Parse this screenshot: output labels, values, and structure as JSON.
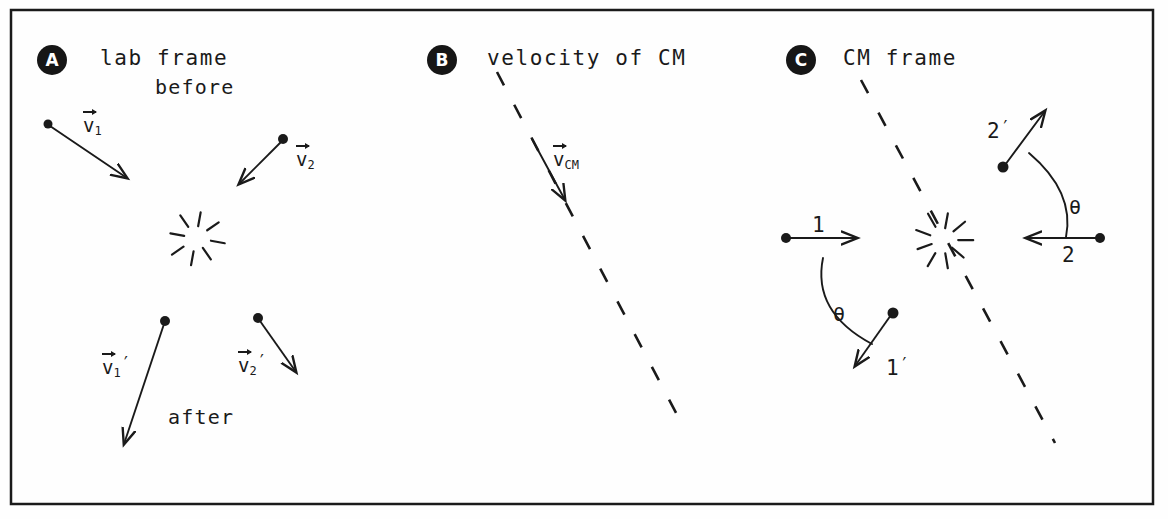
{
  "figure": {
    "width": 1168,
    "height": 519,
    "background_color": "#fefefe",
    "ink_color": "#1a1a1a",
    "border": {
      "x": 11,
      "y": 10,
      "width": 1142,
      "height": 494,
      "stroke_width": 2.5
    }
  },
  "panels": [
    {
      "id": "A",
      "badge_label": "A",
      "badge": {
        "x": 37,
        "y": 45
      },
      "title": "lab frame",
      "title_pos": {
        "x": 100,
        "y": 48
      },
      "labels": [
        {
          "name": "before",
          "text": "before",
          "x": 155,
          "y": 77
        },
        {
          "name": "after",
          "text": "after",
          "x": 168,
          "y": 407
        }
      ],
      "vectors": [
        {
          "name": "v1",
          "label_html": "v<sub>1</sub>",
          "label_x": 83,
          "label_y": 116,
          "dot": {
            "x": 48,
            "y": 124,
            "r": 4.5
          },
          "arrow": {
            "x1": 50,
            "y1": 126,
            "x2": 127,
            "y2": 178
          }
        },
        {
          "name": "v2",
          "label_html": "v<sub>2</sub>",
          "label_x": 296,
          "label_y": 150,
          "dot": {
            "x": 283,
            "y": 139,
            "r": 5
          },
          "arrow": {
            "x1": 281,
            "y1": 142,
            "x2": 239,
            "y2": 184
          }
        },
        {
          "name": "v1-prime",
          "label_html": "v<sub>1</sub>′",
          "label_x": 102,
          "label_y": 355,
          "dot": {
            "x": 165,
            "y": 321,
            "r": 5
          },
          "arrow": {
            "x1": 164,
            "y1": 324,
            "x2": 124,
            "y2": 444
          }
        },
        {
          "name": "v2-prime",
          "label_html": "v<sub>2</sub>′",
          "label_x": 238,
          "label_y": 353,
          "dot": {
            "x": 258,
            "y": 318,
            "r": 5
          },
          "arrow": {
            "x1": 260,
            "y1": 321,
            "x2": 296,
            "y2": 372
          }
        }
      ],
      "starburst": {
        "cx": 196,
        "cy": 238,
        "r_inner": 12,
        "r_outer": 26,
        "spokes": 8
      }
    },
    {
      "id": "B",
      "badge_label": "B",
      "badge": {
        "x": 427,
        "y": 45
      },
      "title": "velocity of CM",
      "title_pos": {
        "x": 487,
        "y": 48
      },
      "dashed_line": {
        "x1": 497,
        "y1": 72,
        "x2": 684,
        "y2": 428
      },
      "vectors": [
        {
          "name": "v-cm",
          "label_html": "v<sub>CM</sub>",
          "label_x": 553,
          "label_y": 150,
          "arrow": {
            "x1": 532,
            "y1": 139,
            "x2": 565,
            "y2": 200
          }
        }
      ]
    },
    {
      "id": "C",
      "badge_label": "C",
      "badge": {
        "x": 786,
        "y": 45
      },
      "title": "CM frame",
      "title_pos": {
        "x": 843,
        "y": 48
      },
      "dashed_line": {
        "x1": 861,
        "y1": 80,
        "x2": 1055,
        "y2": 443
      },
      "starburst": {
        "cx": 943,
        "cy": 240,
        "r_inner": 12,
        "r_outer": 27,
        "spokes": 9
      },
      "vectors": [
        {
          "name": "particle-1-incoming",
          "label_html": "1",
          "label_x": 812,
          "label_y": 215,
          "dot": {
            "x": 786,
            "y": 238,
            "r": 5
          },
          "arrow": {
            "x1": 788,
            "y1": 238,
            "x2": 857,
            "y2": 238
          }
        },
        {
          "name": "particle-2-incoming",
          "label_html": "2",
          "label_x": 1062,
          "label_y": 245,
          "dot": {
            "x": 1100,
            "y": 238,
            "r": 5
          },
          "arrow": {
            "x1": 1098,
            "y1": 238,
            "x2": 1026,
            "y2": 238
          }
        },
        {
          "name": "particle-2-outgoing",
          "label_html": "2′",
          "label_x": 987,
          "label_y": 119,
          "dot": {
            "x": 1003,
            "y": 167,
            "r": 5.5
          },
          "arrow": {
            "x1": 1005,
            "y1": 165,
            "x2": 1045,
            "y2": 111
          }
        },
        {
          "name": "particle-1-outgoing",
          "label_html": "1′",
          "label_x": 886,
          "label_y": 356,
          "dot": {
            "x": 893,
            "y": 313,
            "r": 5.5
          },
          "arrow": {
            "x1": 891,
            "y1": 315,
            "x2": 855,
            "y2": 366
          }
        }
      ],
      "angles": [
        {
          "name": "theta-upper",
          "text": "θ",
          "label_x": 1069,
          "label_y": 197,
          "arc": {
            "x1": 1029,
            "y1": 153,
            "cx": 1075,
            "cy": 192,
            "x2": 1066,
            "y2": 237
          }
        },
        {
          "name": "theta-lower",
          "text": "θ",
          "label_x": 833,
          "label_y": 304,
          "arc": {
            "x1": 823,
            "y1": 258,
            "cx": 812,
            "cy": 312,
            "x2": 872,
            "y2": 344
          }
        }
      ]
    }
  ]
}
